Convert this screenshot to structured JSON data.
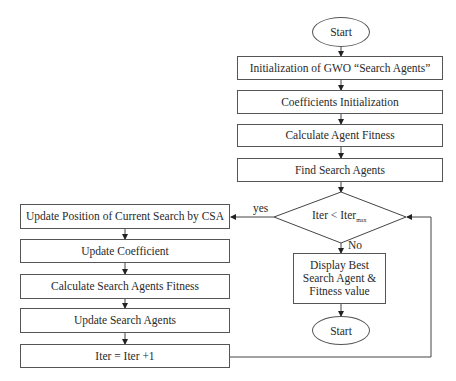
{
  "flowchart": {
    "start": "Start",
    "end": "Start",
    "main_steps": [
      "Initialization of GWO “Search Agents”",
      "Coefficients Initialization",
      "Calculate Agent Fitness",
      "Find Search Agents"
    ],
    "decision": {
      "text": "Iter < Iter",
      "subscript": "max",
      "yes": "yes",
      "no": "No"
    },
    "loop_steps": [
      "Update Position of Current Search by CSA",
      "Update Coefficient",
      "Calculate Search Agents Fitness",
      "Update Search Agents",
      "Iter = Iter +1"
    ],
    "output": "Display Best Search Agent & Fitness value"
  }
}
